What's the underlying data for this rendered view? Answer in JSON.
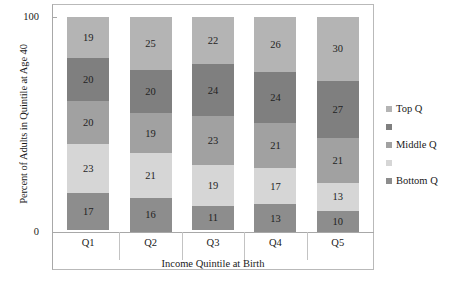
{
  "chart_data": {
    "type": "bar",
    "stacked": true,
    "title": "",
    "xlabel": "Income Quintile at Birth",
    "ylabel": "Percent of Adults in Quintile at Age 40",
    "categories": [
      "Q1",
      "Q2",
      "Q3",
      "Q4",
      "Q5"
    ],
    "ylim": [
      0,
      100
    ],
    "ytick_labels": [
      "0",
      "100"
    ],
    "grid": false,
    "legend_position": "right",
    "series": [
      {
        "name": "Top Q",
        "color": "#b4b4b4",
        "values": [
          19,
          25,
          22,
          26,
          30
        ]
      },
      {
        "name": "",
        "color": "#7f7f7f",
        "values": [
          20,
          20,
          24,
          24,
          27
        ]
      },
      {
        "name": "Middle Q",
        "color": "#a1a1a1",
        "values": [
          20,
          19,
          23,
          21,
          21
        ]
      },
      {
        "name": "",
        "color": "#d6d6d6",
        "values": [
          23,
          21,
          19,
          17,
          13
        ]
      },
      {
        "name": "Bottom Q",
        "color": "#8d8d8d",
        "values": [
          17,
          16,
          11,
          13,
          10
        ]
      }
    ]
  }
}
